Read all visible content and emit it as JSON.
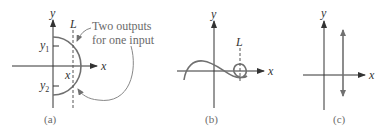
{
  "figure": {
    "panels": [
      {
        "id": "a",
        "caption": "(a)",
        "x_axis_label": "x",
        "y_axis_label": "y",
        "line_label": "L",
        "y_tick_labels": [
          "y1",
          "y2"
        ],
        "y_tick_subscripts": [
          "1",
          "2"
        ],
        "x_tick_label": "x",
        "annotation_line1": "Two outputs",
        "annotation_line2": "for one input",
        "curve": "right half-circle (semicircle) centered at origin",
        "vertical_line": "dashed line L crossing the curve at two points"
      },
      {
        "id": "b",
        "caption": "(b)",
        "x_axis_label": "x",
        "y_axis_label": "y",
        "line_label": "L",
        "curve": "wave curve ending in a loop on the right",
        "vertical_line": "dashed line L passing through the loop"
      },
      {
        "id": "c",
        "caption": "(c)",
        "x_axis_label": "x",
        "y_axis_label": "y",
        "curve": "vertical line with arrows on both ends"
      }
    ]
  },
  "colors": {
    "axis": "#333333",
    "curve": "#707070",
    "annotation_text": "#6a6a6a"
  }
}
